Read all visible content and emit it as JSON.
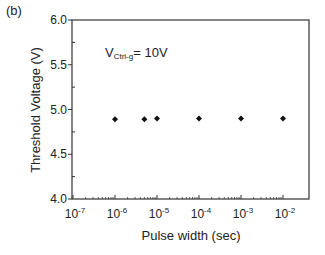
{
  "panel_label": "(b)",
  "annotation": {
    "main": "V",
    "sub": "Ctrl-g",
    "rest": "= 10V"
  },
  "chart_data": {
    "type": "scatter",
    "title": "",
    "panel": "(b)",
    "xlabel": "Pulse width (sec)",
    "ylabel": "Threshold Voltage (V)",
    "xscale": "log",
    "xlim": [
      1e-07,
      0.01
    ],
    "ylim": [
      4.0,
      6.0
    ],
    "x_tick_labels": [
      {
        "base": "10",
        "exp": "-7",
        "value": 1e-07
      },
      {
        "base": "10",
        "exp": "-6",
        "value": 1e-06
      },
      {
        "base": "10",
        "exp": "-5",
        "value": 1e-05
      },
      {
        "base": "10",
        "exp": "-4",
        "value": 0.0001
      },
      {
        "base": "10",
        "exp": "-3",
        "value": 0.001
      },
      {
        "base": "10",
        "exp": "-2",
        "value": 0.01
      }
    ],
    "y_ticks": [
      "4.0",
      "4.5",
      "5.0",
      "5.5",
      "6.0"
    ],
    "annotation": "V_Ctrl-g = 10V",
    "grid": false,
    "legend": null,
    "marker": "diamond",
    "series": [
      {
        "name": "V_Ctrl-g = 10V",
        "x": [
          1e-06,
          5e-06,
          1e-05,
          0.0001,
          0.001,
          0.01
        ],
        "y": [
          4.89,
          4.89,
          4.9,
          4.9,
          4.9,
          4.9
        ]
      }
    ]
  }
}
